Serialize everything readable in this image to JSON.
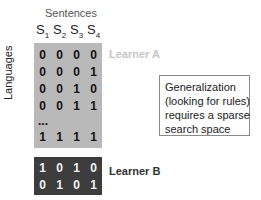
{
  "title": "Sentences",
  "row_axis_label": "Languages",
  "sentence_headers": [
    {
      "base": "S",
      "sub": "1"
    },
    {
      "base": "S",
      "sub": "2"
    },
    {
      "base": "S",
      "sub": "3"
    },
    {
      "base": "S",
      "sub": "4"
    }
  ],
  "learner_a": {
    "label": "Learner A",
    "rows": [
      [
        "0",
        "0",
        "0",
        "0"
      ],
      [
        "0",
        "0",
        "0",
        "1"
      ],
      [
        "0",
        "0",
        "1",
        "0"
      ],
      [
        "0",
        "0",
        "1",
        "1"
      ]
    ],
    "ellipsis": "...",
    "last_row": [
      "1",
      "1",
      "1",
      "1"
    ],
    "color": "#b9b9b9"
  },
  "learner_b": {
    "label": "Learner B",
    "rows": [
      [
        "1",
        "0",
        "1",
        "0"
      ],
      [
        "0",
        "1",
        "0",
        "1"
      ]
    ],
    "color": "#3d3d3d"
  },
  "callout": {
    "lines": [
      "Generalization",
      "(looking for rules)",
      "requires a sparse",
      "search space"
    ]
  }
}
